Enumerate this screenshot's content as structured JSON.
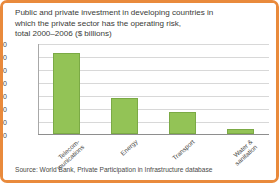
{
  "figure": {
    "border_color": "#E98A3C",
    "background_color": "#FFFFFF"
  },
  "title": "Public and private investment in developing countries in\nwhich the private sector has the operating risk,\ntotal 2000–2006 ($ billions)",
  "source_note": "Source: World Bank, Private Participation in Infrastructure database",
  "chart_data": {
    "type": "bar",
    "title": "Public and private investment in developing countries in which the private sector has the operating risk, total 2000–2006 ($ billions)",
    "xlabel": "",
    "ylabel": "",
    "ylim": [
      0,
      350
    ],
    "yticks": [
      0,
      50,
      100,
      150,
      200,
      250,
      300,
      350
    ],
    "ytick_labels": [
      "0",
      "50",
      "100",
      "150",
      "200",
      "250",
      "300",
      "350"
    ],
    "grid": true,
    "legend": false,
    "bar_color": "#93C356",
    "bar_edge_color": "#7BAA45",
    "units": "$ billions",
    "categories": [
      "Telecom-\nmunications",
      "Energy",
      "Transport",
      "Water &\nsanitation"
    ],
    "category_labels_plain": [
      "Telecom-munications",
      "Energy",
      "Transport",
      "Water & sanitation"
    ],
    "values": [
      310,
      137,
      85,
      18
    ]
  }
}
